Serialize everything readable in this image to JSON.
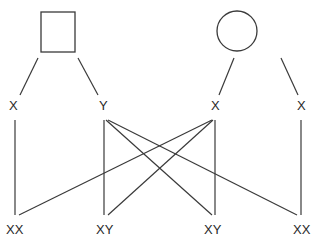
{
  "parents": {
    "male": {
      "symbol": "square",
      "gametes": [
        "X",
        "Y"
      ]
    },
    "female": {
      "symbol": "circle",
      "gametes": [
        "X",
        "X"
      ]
    }
  },
  "offspring": [
    "XX",
    "XY",
    "XY",
    "XX"
  ],
  "colors": {
    "line": "#3a3a3a",
    "text": "#2a2a2a",
    "background": "#ffffff"
  }
}
